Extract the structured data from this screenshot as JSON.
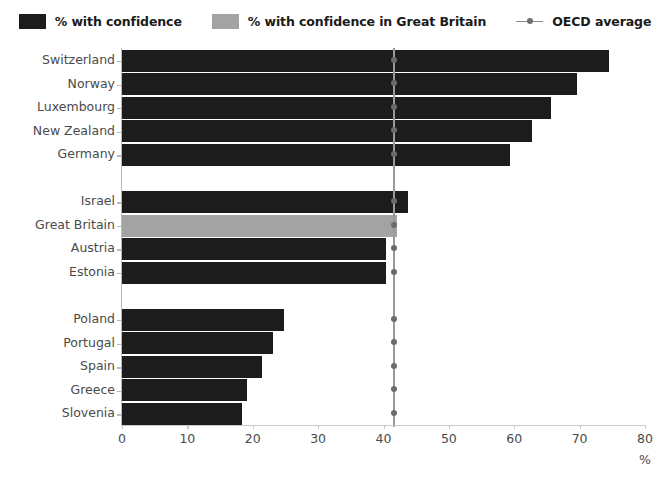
{
  "legend": {
    "items": [
      {
        "label": "% with confidence",
        "type": "swatch",
        "color": "#1c1c1c",
        "icon": "dark-square-icon"
      },
      {
        "label": "% with confidence in Great Britain",
        "type": "swatch",
        "color": "#a3a3a3",
        "icon": "gray-square-icon"
      },
      {
        "label": "OECD average",
        "type": "line-marker",
        "color": "#8a8a8a",
        "icon": "line-with-dot-icon"
      }
    ]
  },
  "chart_data": {
    "type": "bar",
    "orientation": "horizontal",
    "title": "",
    "xlabel": "%",
    "ylabel": "",
    "xlim": [
      0,
      80
    ],
    "xticks": [
      0,
      10,
      20,
      30,
      40,
      50,
      60,
      70,
      80
    ],
    "grid": false,
    "legend_position": "top",
    "categories": [
      "Switzerland",
      "Norway",
      "Luxembourg",
      "New Zealand",
      "Germany",
      "",
      "Israel",
      "Great Britain",
      "Austria",
      "Estonia",
      "",
      "Poland",
      "Portugal",
      "Spain",
      "Greece",
      "Slovenia"
    ],
    "values": [
      74.5,
      69.6,
      65.6,
      62.7,
      59.3,
      null,
      43.7,
      42.0,
      40.4,
      40.4,
      null,
      24.8,
      23.1,
      21.4,
      19.1,
      18.4
    ],
    "bar_styles": [
      "dark",
      "dark",
      "dark",
      "dark",
      "dark",
      "gap",
      "dark",
      "light",
      "dark",
      "dark",
      "gap",
      "dark",
      "dark",
      "dark",
      "dark",
      "dark"
    ],
    "reference_line": {
      "name": "OECD average",
      "value": 41.6,
      "color": "#9a9a9a",
      "marker": "circle"
    },
    "colors": {
      "dark": "#1c1c1c",
      "light": "#a3a3a3",
      "reference": "#9a9a9a",
      "axis": "#b8b8b8",
      "text": "#4a4a4a"
    }
  }
}
